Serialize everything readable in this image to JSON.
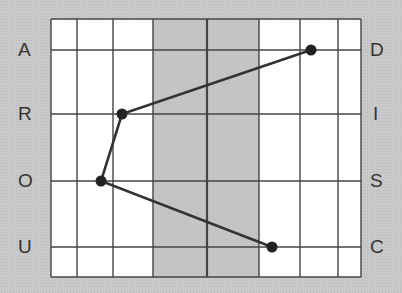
{
  "diagram": {
    "type": "grid-path-puzzle",
    "left_labels": [
      "A",
      "R",
      "O",
      "U"
    ],
    "right_labels": [
      "D",
      "I",
      "S",
      "C"
    ],
    "columns": [
      {
        "x1": 51,
        "x2": 77,
        "shade": "white"
      },
      {
        "x1": 77,
        "x2": 113,
        "shade": "white"
      },
      {
        "x1": 113,
        "x2": 153,
        "shade": "white"
      },
      {
        "x1": 153,
        "x2": 207,
        "shade": "gray"
      },
      {
        "x1": 207,
        "x2": 259,
        "shade": "gray"
      },
      {
        "x1": 259,
        "x2": 300,
        "shade": "white"
      },
      {
        "x1": 300,
        "x2": 338,
        "shade": "white"
      },
      {
        "x1": 338,
        "x2": 361,
        "shade": "white"
      }
    ],
    "rows_y": [
      19,
      50,
      114,
      181,
      247,
      277
    ],
    "points": [
      {
        "x": 311,
        "y": 50,
        "row_label": "D"
      },
      {
        "x": 122,
        "y": 114,
        "row_label": "R"
      },
      {
        "x": 101,
        "y": 181,
        "row_label": "O"
      },
      {
        "x": 272,
        "y": 247,
        "row_label": "C"
      }
    ],
    "colors": {
      "line": "#333333",
      "point": "#222222",
      "background": "#c9c9c9",
      "cell_white": "#ffffff",
      "cell_gray": "#c4c4c4"
    }
  }
}
